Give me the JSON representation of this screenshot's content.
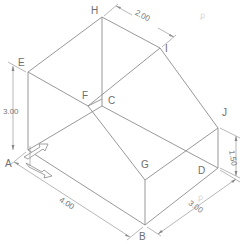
{
  "figure": {
    "type": "isometric-drawing",
    "colors": {
      "line": "#8c8c8c",
      "text": "#6e6e6e",
      "background": "#ffffff"
    }
  },
  "vertices": {
    "A": "A",
    "B": "B",
    "C": "C",
    "D": "D",
    "E": "E",
    "F": "F",
    "G": "G",
    "H": "H",
    "I": "I",
    "J": "J"
  },
  "dimensions": {
    "top_width": "2.00",
    "left_height": "3.00",
    "right_height": "1.50",
    "front_length": "4.00",
    "right_depth": "3.00"
  },
  "icons": {
    "axis_indicator": "isometric-axis-arrows-icon",
    "watermark_top": "faint-watermark",
    "watermark_bottom": "faint-watermark"
  }
}
